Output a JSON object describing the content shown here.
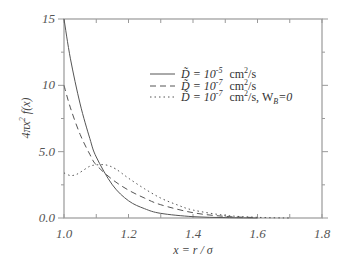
{
  "chart_data": {
    "type": "line",
    "title": "",
    "xlabel": "x = r / σ",
    "ylabel": "4πx² f(x)",
    "xlim": [
      1.0,
      1.8
    ],
    "ylim": [
      0,
      15
    ],
    "x_ticks": [
      "1.0",
      "1.2",
      "1.4",
      "1.6",
      "1.8"
    ],
    "y_ticks": [
      "0.0",
      "5.0",
      "10",
      "15"
    ],
    "grid": false,
    "legend_position": "upper right (inside)",
    "series": [
      {
        "name": "D̃ = 10⁻⁵ cm²/s",
        "style": "solid",
        "x": [
          1.0,
          1.02,
          1.05,
          1.08,
          1.1,
          1.15,
          1.2,
          1.25,
          1.3,
          1.4,
          1.5,
          1.6
        ],
        "y": [
          15.0,
          12.0,
          8.6,
          6.0,
          4.6,
          2.5,
          1.3,
          0.7,
          0.35,
          0.1,
          0.03,
          0.0
        ]
      },
      {
        "name": "D̃ = 10⁻⁷ cm²/s",
        "style": "dashed",
        "x": [
          1.0,
          1.02,
          1.05,
          1.08,
          1.1,
          1.15,
          1.2,
          1.25,
          1.3,
          1.4,
          1.5,
          1.6
        ],
        "y": [
          10.0,
          8.3,
          6.3,
          4.8,
          4.0,
          2.9,
          2.1,
          1.5,
          1.0,
          0.4,
          0.12,
          0.03
        ]
      },
      {
        "name": "D̃ = 10⁻⁷ cm²/s, W_B=0",
        "style": "dotted",
        "x": [
          1.0,
          1.02,
          1.04,
          1.06,
          1.08,
          1.1,
          1.13,
          1.16,
          1.2,
          1.25,
          1.3,
          1.35,
          1.4,
          1.5,
          1.6,
          1.7
        ],
        "y": [
          3.4,
          3.2,
          3.3,
          3.6,
          3.9,
          4.0,
          4.0,
          3.7,
          3.0,
          2.2,
          1.5,
          1.0,
          0.6,
          0.2,
          0.05,
          0.0
        ]
      }
    ]
  },
  "legend": {
    "items": [
      {
        "prefix": "D̃ = 10",
        "exp": "-5",
        "unit": "cm",
        "unit_exp": "2",
        "suffix": "/s"
      },
      {
        "prefix": "D̃ = 10",
        "exp": "-7",
        "unit": "cm",
        "unit_exp": "2",
        "suffix": "/s"
      },
      {
        "prefix": "D̃ = 10",
        "exp": "-7",
        "unit": "cm",
        "unit_exp": "2",
        "suffix": "/s, W",
        "sub": "B",
        "tail": "=0"
      }
    ]
  },
  "axes": {
    "xlabel": "x = r / σ",
    "ylabel_main": "4πx",
    "ylabel_exp": "2",
    "ylabel_tail": " f(x)"
  },
  "colors": {
    "axis": "#999999",
    "line": "#555555"
  }
}
